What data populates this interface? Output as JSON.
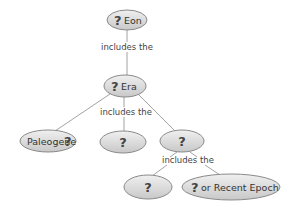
{
  "diagram": {
    "type": "concept-map",
    "colors": {
      "node_fill": "#d9d9d9",
      "node_stroke": "#8a8a8a",
      "text": "#333333",
      "edge": "#8a8a8a"
    },
    "nodes": [
      {
        "id": "eon",
        "prefix": "?",
        "label": "Eon"
      },
      {
        "id": "era",
        "prefix": "?",
        "label": "Era"
      },
      {
        "id": "paleogene",
        "label": "Paleogene",
        "suffix": "?"
      },
      {
        "id": "era-child-mid",
        "prefix": "?",
        "label": ""
      },
      {
        "id": "era-child-right",
        "prefix": "?",
        "label": ""
      },
      {
        "id": "period-child-left",
        "prefix": "?",
        "label": ""
      },
      {
        "id": "recent-epoch",
        "prefix": "?",
        "label": "or Recent Epoch"
      }
    ],
    "links": [
      {
        "from": "eon",
        "to": "era",
        "label": "includes the"
      },
      {
        "from": "era",
        "to": [
          "paleogene",
          "era-child-mid",
          "era-child-right"
        ],
        "label": "includes the"
      },
      {
        "from": "era-child-right",
        "to": [
          "period-child-left",
          "recent-epoch"
        ],
        "label": "includes the"
      }
    ]
  }
}
